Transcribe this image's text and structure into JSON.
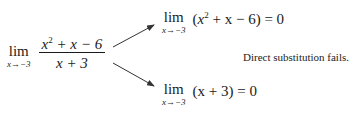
{
  "main_limit": {
    "lim": "lim",
    "subscript": "x→−3",
    "numerator": {
      "pre": "x",
      "exp": "2",
      "post": " + x − 6"
    },
    "denominator": "x + 3"
  },
  "top_limit": {
    "lim": "lim",
    "subscript": "x→−3",
    "open": "(",
    "var": "x",
    "exp": "2",
    "rest": " + x − 6) = 0"
  },
  "bottom_limit": {
    "lim": "lim",
    "subscript": "x→−3",
    "expr": "(x + 3) = 0"
  },
  "annotation": "Direct substitution fails.",
  "colors": {
    "ink": "#1a1a1a",
    "arrow": "#333333"
  }
}
